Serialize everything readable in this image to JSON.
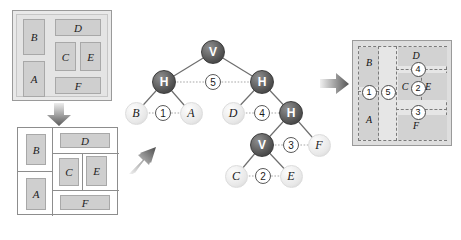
{
  "figure": {
    "modules": [
      "A",
      "B",
      "C",
      "D",
      "E",
      "F"
    ],
    "cut_labels": [
      "1",
      "2",
      "3",
      "4",
      "5"
    ]
  },
  "panel1": {
    "name": "module-set",
    "blocks": [
      {
        "label": "B",
        "x": 10,
        "y": 8,
        "w": 22,
        "h": 36
      },
      {
        "label": "A",
        "x": 10,
        "y": 50,
        "w": 22,
        "h": 36
      },
      {
        "label": "D",
        "x": 42,
        "y": 8,
        "w": 46,
        "h": 17
      },
      {
        "label": "C",
        "x": 42,
        "y": 31,
        "w": 21,
        "h": 29
      },
      {
        "label": "E",
        "x": 67,
        "y": 31,
        "w": 21,
        "h": 29
      },
      {
        "label": "F",
        "x": 42,
        "y": 66,
        "w": 46,
        "h": 17
      }
    ]
  },
  "panel2": {
    "name": "slicing-floorplan",
    "blocks": [
      {
        "label": "B",
        "x": 10,
        "y": 8,
        "w": 22,
        "h": 30
      },
      {
        "label": "A",
        "x": 10,
        "y": 48,
        "w": 22,
        "h": 32
      },
      {
        "label": "D",
        "x": 45,
        "y": 7,
        "w": 44,
        "h": 15
      },
      {
        "label": "C",
        "x": 42,
        "y": 30,
        "w": 20,
        "h": 26
      },
      {
        "label": "E",
        "x": 66,
        "y": 28,
        "w": 21,
        "h": 28
      },
      {
        "label": "F",
        "x": 45,
        "y": 66,
        "w": 44,
        "h": 15
      }
    ]
  },
  "tree": {
    "name": "slicing-tree",
    "nodes": [
      {
        "id": "v-root",
        "label": "V",
        "type": "internal",
        "x": 213,
        "y": 52
      },
      {
        "id": "h-left",
        "label": "H",
        "type": "internal",
        "x": 164,
        "y": 82
      },
      {
        "id": "h-right",
        "label": "H",
        "type": "internal",
        "x": 262,
        "y": 82
      },
      {
        "id": "leaf-b",
        "label": "B",
        "type": "leaf",
        "x": 136,
        "y": 113
      },
      {
        "id": "leaf-a",
        "label": "A",
        "type": "leaf",
        "x": 191,
        "y": 113
      },
      {
        "id": "leaf-d",
        "label": "D",
        "type": "leaf",
        "x": 233,
        "y": 113
      },
      {
        "id": "h-low",
        "label": "H",
        "type": "internal",
        "x": 291,
        "y": 113
      },
      {
        "id": "v-low",
        "label": "V",
        "type": "internal",
        "x": 262,
        "y": 145
      },
      {
        "id": "leaf-f",
        "label": "F",
        "type": "leaf",
        "x": 319,
        "y": 145
      },
      {
        "id": "leaf-c",
        "label": "C",
        "type": "leaf",
        "x": 236,
        "y": 176
      },
      {
        "id": "leaf-e",
        "label": "E",
        "type": "leaf",
        "x": 291,
        "y": 176
      }
    ],
    "cut_markers": [
      {
        "label": "5",
        "x": 213,
        "y": 82
      },
      {
        "label": "1",
        "x": 163,
        "y": 113
      },
      {
        "label": "4",
        "x": 262,
        "y": 113
      },
      {
        "label": "3",
        "x": 291,
        "y": 145
      },
      {
        "label": "2",
        "x": 263,
        "y": 176
      }
    ],
    "edges": [
      {
        "from": "v-root",
        "to": "h-left"
      },
      {
        "from": "v-root",
        "to": "h-right"
      },
      {
        "from": "h-left",
        "to": "leaf-b"
      },
      {
        "from": "h-left",
        "to": "leaf-a"
      },
      {
        "from": "h-right",
        "to": "leaf-d"
      },
      {
        "from": "h-right",
        "to": "h-low"
      },
      {
        "from": "h-low",
        "to": "v-low"
      },
      {
        "from": "h-low",
        "to": "leaf-f"
      },
      {
        "from": "v-low",
        "to": "leaf-c"
      },
      {
        "from": "v-low",
        "to": "leaf-e"
      }
    ]
  },
  "panel4": {
    "name": "annotated-floorplan",
    "labels": [
      {
        "text": "B",
        "x": 22,
        "y": 20
      },
      {
        "text": "A",
        "x": 22,
        "y": 72
      },
      {
        "text": "D",
        "x": 60,
        "y": 11
      },
      {
        "text": "C",
        "x": 46,
        "y": 46
      },
      {
        "text": "E",
        "x": 76,
        "y": 46
      },
      {
        "text": "F",
        "x": 60,
        "y": 81
      }
    ],
    "cut_circles": [
      {
        "label": "1",
        "x": 13,
        "y": 46
      },
      {
        "label": "5",
        "x": 33,
        "y": 46
      },
      {
        "label": "2",
        "x": 61,
        "y": 46
      },
      {
        "label": "4",
        "x": 61,
        "y": 25
      },
      {
        "label": "3",
        "x": 61,
        "y": 68
      }
    ]
  },
  "arrows": [
    {
      "name": "arrow-down",
      "direction": "down"
    },
    {
      "name": "arrow-up-right",
      "direction": "up-right"
    },
    {
      "name": "arrow-right",
      "direction": "right"
    }
  ]
}
